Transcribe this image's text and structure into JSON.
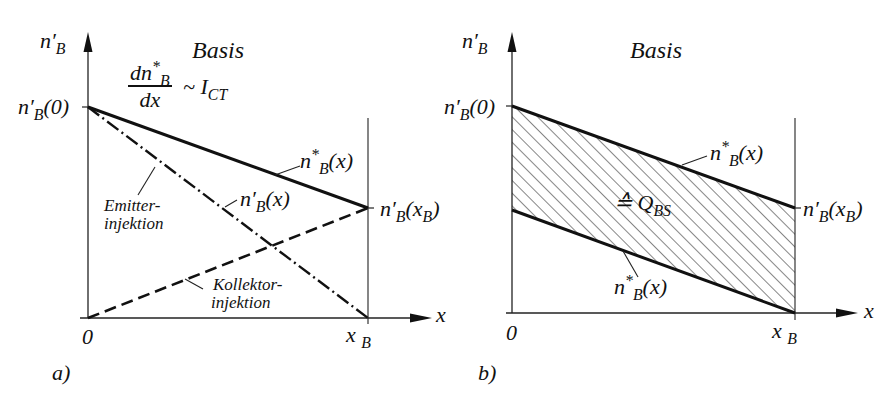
{
  "panel_a": {
    "caption": "a)",
    "region_label": "Basis",
    "y_axis_label": "n'_B",
    "x_axis_label": "x",
    "origin_label": "0",
    "xb_label": "x_B",
    "y0_label": "n'_B(0)",
    "yxb_label": "n'_B(x_B)",
    "formula": {
      "numerator": "dn*_B",
      "denominator": "dx",
      "relation": "~ I_CT"
    },
    "curves": [
      {
        "name": "n*_B(x)",
        "style": "solid",
        "from": [
          0,
          1.0
        ],
        "to": [
          1,
          0.5
        ]
      },
      {
        "name": "n'_B(x) emitter",
        "style": "dash-dot",
        "from": [
          0,
          1.0
        ],
        "to": [
          1,
          0.0
        ]
      },
      {
        "name": "collector",
        "style": "dashed",
        "from": [
          0,
          0.0
        ],
        "to": [
          1,
          0.5
        ]
      }
    ],
    "annotations": {
      "nstar": "n*_B(x)",
      "nprime": "n'_B(x)",
      "emitter_1": "Emitter-",
      "emitter_2": "injektion",
      "kollektor_1": "Kollektor-",
      "kollektor_2": "injektion"
    }
  },
  "panel_b": {
    "caption": "b)",
    "region_label": "Basis",
    "y_axis_label": "n'_B",
    "x_axis_label": "x",
    "origin_label": "0",
    "xb_label": "x_B",
    "y0_label": "n'_B(0)",
    "yxb_label": "n'_B(x_B)",
    "area_label": "≙ Q_BS",
    "upper_curve": "n*_B(x)",
    "lower_curve": "n*_B(x)"
  },
  "colors": {
    "ink": "#111111",
    "background": "#ffffff"
  }
}
